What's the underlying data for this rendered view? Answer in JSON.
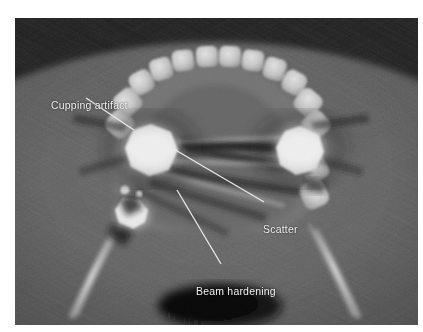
{
  "figure": {
    "modality": "cone-beam-ct",
    "view": "axial-mandible",
    "background_color": "#ffffff",
    "image_background_color": "#000000",
    "label_color": "#f2f2f2",
    "leader_color": "#e8e8e8"
  },
  "annotations": [
    {
      "id": "cupping",
      "label": "Cupping artifact",
      "leader": {
        "x1": 86,
        "y1": 98,
        "x2": 134,
        "y2": 130
      }
    },
    {
      "id": "scatter",
      "label": "Scatter",
      "leader": {
        "x1": 172,
        "y1": 148,
        "x2": 264,
        "y2": 202
      }
    },
    {
      "id": "beam_hardening",
      "label": "Beam hardening",
      "leader": {
        "x1": 177,
        "y1": 190,
        "x2": 221,
        "y2": 264
      }
    }
  ],
  "anatomy": {
    "soft_tissue_outline": "mandibular soft tissue envelope",
    "dental_arch": "mandibular tooth row",
    "teeth_count": 14,
    "airway_cavity": "posterior air space",
    "metallic_restorations": 3
  }
}
